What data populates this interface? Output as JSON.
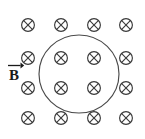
{
  "figure": {
    "background_color": "#ffffff",
    "width": 145,
    "height": 139
  },
  "vector_label": {
    "symbol": "B",
    "notation": "vector-arrow-overbar",
    "meaning": "magnetic field vector",
    "x": 14,
    "y": 78,
    "color": "#1a1a1a"
  },
  "loop": {
    "name": "circular-loop",
    "shape": "circle",
    "cx": 79,
    "cy": 74,
    "rx": 40,
    "ry": 39,
    "stroke_color": "#4a4a4a",
    "stroke_width": 1.15,
    "fill": "none"
  },
  "field_symbols": {
    "glyph": "circle-with-x",
    "unicode": "⊗",
    "meaning": "field-into-page",
    "radius": 6.4,
    "stroke_color": "#3a3a3a",
    "columns_x": [
      28,
      61,
      94,
      126
    ],
    "rows_y": [
      25,
      58,
      88,
      118
    ],
    "count": 16,
    "inside_loop_count": 4,
    "points": [
      {
        "col": 0,
        "row": 0,
        "x": 28,
        "y": 25,
        "inside_loop": false
      },
      {
        "col": 1,
        "row": 0,
        "x": 61,
        "y": 25,
        "inside_loop": false
      },
      {
        "col": 2,
        "row": 0,
        "x": 94,
        "y": 25,
        "inside_loop": false
      },
      {
        "col": 3,
        "row": 0,
        "x": 126,
        "y": 25,
        "inside_loop": false
      },
      {
        "col": 0,
        "row": 1,
        "x": 28,
        "y": 58,
        "inside_loop": false
      },
      {
        "col": 1,
        "row": 1,
        "x": 61,
        "y": 58,
        "inside_loop": true
      },
      {
        "col": 2,
        "row": 1,
        "x": 94,
        "y": 58,
        "inside_loop": true
      },
      {
        "col": 3,
        "row": 1,
        "x": 126,
        "y": 58,
        "inside_loop": false
      },
      {
        "col": 0,
        "row": 2,
        "x": 28,
        "y": 88,
        "inside_loop": false
      },
      {
        "col": 1,
        "row": 2,
        "x": 61,
        "y": 88,
        "inside_loop": true
      },
      {
        "col": 2,
        "row": 2,
        "x": 94,
        "y": 88,
        "inside_loop": true
      },
      {
        "col": 3,
        "row": 2,
        "x": 126,
        "y": 88,
        "inside_loop": false
      },
      {
        "col": 0,
        "row": 3,
        "x": 28,
        "y": 118,
        "inside_loop": false
      },
      {
        "col": 1,
        "row": 3,
        "x": 61,
        "y": 118,
        "inside_loop": false
      },
      {
        "col": 2,
        "row": 3,
        "x": 94,
        "y": 118,
        "inside_loop": false
      },
      {
        "col": 3,
        "row": 3,
        "x": 126,
        "y": 118,
        "inside_loop": false
      }
    ]
  }
}
